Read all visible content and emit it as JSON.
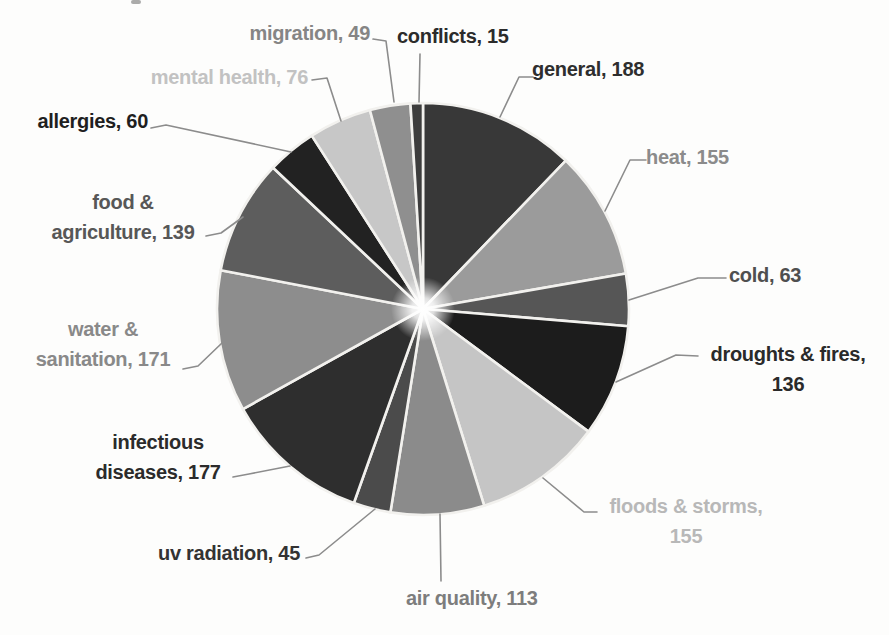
{
  "chart_data": {
    "type": "pie",
    "title": "",
    "legend": "none",
    "background": "#fdfdfc",
    "divider_color": "#f2f1ee",
    "leader_line_color": "#8c8c8c",
    "start_angle_deg": -90,
    "direction": "clockwise",
    "categories": [
      "general",
      "heat",
      "cold",
      "droughts & fires",
      "floods & storms",
      "air quality",
      "uv radiation",
      "infectious diseases",
      "water & sanitation",
      "food & agriculture",
      "allergies",
      "mental health",
      "migration",
      "conflicts"
    ],
    "values": [
      188,
      155,
      63,
      136,
      155,
      113,
      45,
      177,
      171,
      139,
      60,
      76,
      49,
      15
    ],
    "slices": [
      {
        "name": "general",
        "value": 188,
        "color": "#383838",
        "label_color": "#2e2e2e",
        "label_lines": [
          "general, 188"
        ]
      },
      {
        "name": "heat",
        "value": 155,
        "color": "#9b9b9b",
        "label_color": "#8b8b8b",
        "label_lines": [
          "heat, 155"
        ]
      },
      {
        "name": "cold",
        "value": 63,
        "color": "#575757",
        "label_color": "#4f4f4f",
        "label_lines": [
          "cold, 63"
        ]
      },
      {
        "name": "droughts & fires",
        "value": 136,
        "color": "#1c1c1c",
        "label_color": "#2a2a2a",
        "label_lines": [
          "droughts & fires,",
          "136"
        ]
      },
      {
        "name": "floods & storms",
        "value": 155,
        "color": "#c5c5c5",
        "label_color": "#b8b8b8",
        "label_lines": [
          "floods & storms,",
          "155"
        ]
      },
      {
        "name": "air quality",
        "value": 113,
        "color": "#8b8b8b",
        "label_color": "#7d7d7d",
        "label_lines": [
          "air quality, 113"
        ]
      },
      {
        "name": "uv radiation",
        "value": 45,
        "color": "#4b4b4b",
        "label_color": "#333333",
        "label_lines": [
          "uv radiation, 45"
        ]
      },
      {
        "name": "infectious diseases",
        "value": 177,
        "color": "#2d2d2d",
        "label_color": "#2b2b2b",
        "label_lines": [
          "infectious",
          "diseases, 177"
        ]
      },
      {
        "name": "water & sanitation",
        "value": 171,
        "color": "#8d8d8d",
        "label_color": "#898989",
        "label_lines": [
          "water &",
          "sanitation, 171"
        ]
      },
      {
        "name": "food & agriculture",
        "value": 139,
        "color": "#5d5d5d",
        "label_color": "#575757",
        "label_lines": [
          "food &",
          "agriculture, 139"
        ]
      },
      {
        "name": "allergies",
        "value": 60,
        "color": "#212121",
        "label_color": "#1f1f1f",
        "label_lines": [
          "allergies, 60"
        ]
      },
      {
        "name": "mental health",
        "value": 76,
        "color": "#c7c7c7",
        "label_color": "#c2c2c2",
        "label_lines": [
          "mental health, 76"
        ]
      },
      {
        "name": "migration",
        "value": 49,
        "color": "#8f8f8f",
        "label_color": "#858585",
        "label_lines": [
          "migration, 49"
        ]
      },
      {
        "name": "conflicts",
        "value": 15,
        "color": "#3e3e3e",
        "label_color": "#2b2b2b",
        "label_lines": [
          "conflicts, 15"
        ]
      }
    ]
  }
}
